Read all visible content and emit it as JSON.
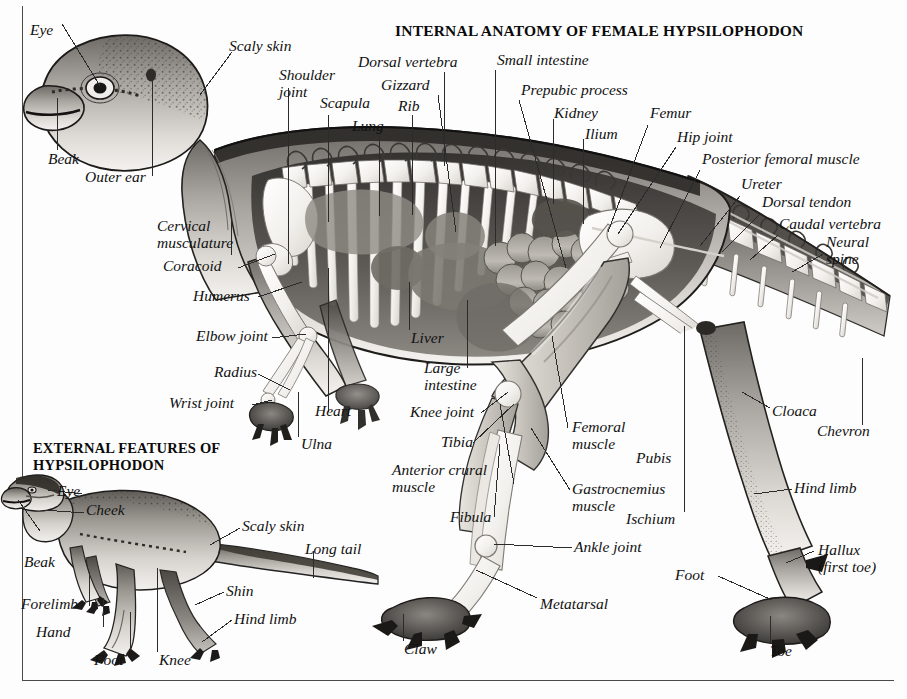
{
  "page": {
    "main_title": "INTERNAL ANATOMY OF FEMALE HYPSILOPHODON",
    "sub_title": "EXTERNAL FEATURES OF\nHYPSILOPHODON",
    "background_color": "#fdfdfd",
    "ink_color": "#111111",
    "frame_color": "#4a4a4a"
  },
  "internal_labels": [
    {
      "id": "eye",
      "text": "Eye"
    },
    {
      "id": "scaly-skin",
      "text": "Scaly skin"
    },
    {
      "id": "beak",
      "text": "Beak"
    },
    {
      "id": "outer-ear",
      "text": "Outer ear"
    },
    {
      "id": "shoulder-joint",
      "text": "Shoulder\njoint"
    },
    {
      "id": "scapula",
      "text": "Scapula"
    },
    {
      "id": "lung",
      "text": "Lung"
    },
    {
      "id": "dorsal-vertebra",
      "text": "Dorsal vertebra"
    },
    {
      "id": "gizzard",
      "text": "Gizzard"
    },
    {
      "id": "rib",
      "text": "Rib"
    },
    {
      "id": "small-intestine",
      "text": "Small intestine"
    },
    {
      "id": "prepubic-process",
      "text": "Prepubic process"
    },
    {
      "id": "kidney",
      "text": "Kidney"
    },
    {
      "id": "ilium",
      "text": "Ilium"
    },
    {
      "id": "femur",
      "text": "Femur"
    },
    {
      "id": "hip-joint",
      "text": "Hip joint"
    },
    {
      "id": "posterior-femoral-muscle",
      "text": "Posterior femoral muscle"
    },
    {
      "id": "ureter",
      "text": "Ureter"
    },
    {
      "id": "dorsal-tendon",
      "text": "Dorsal tendon"
    },
    {
      "id": "caudal-vertebra",
      "text": "Caudal vertebra"
    },
    {
      "id": "neural-spine",
      "text": "Neural\nspine"
    },
    {
      "id": "cervical-musculature",
      "text": "Cervical\nmusculature"
    },
    {
      "id": "coracoid",
      "text": "Coracoid"
    },
    {
      "id": "humerus",
      "text": "Humerus"
    },
    {
      "id": "elbow-joint",
      "text": "Elbow joint"
    },
    {
      "id": "radius",
      "text": "Radius"
    },
    {
      "id": "wrist-joint",
      "text": "Wrist joint"
    },
    {
      "id": "heart",
      "text": "Heart"
    },
    {
      "id": "ulna",
      "text": "Ulna"
    },
    {
      "id": "liver",
      "text": "Liver"
    },
    {
      "id": "large-intestine",
      "text": "Large\nintestine"
    },
    {
      "id": "knee-joint",
      "text": "Knee joint"
    },
    {
      "id": "tibia",
      "text": "Tibia"
    },
    {
      "id": "anterior-crural-muscle",
      "text": "Anterior crural\nmuscle"
    },
    {
      "id": "fibula",
      "text": "Fibula"
    },
    {
      "id": "femoral-muscle",
      "text": "Femoral\nmuscle"
    },
    {
      "id": "gastrocnemius-muscle",
      "text": "Gastrocnemius\nmuscle"
    },
    {
      "id": "pubis",
      "text": "Pubis"
    },
    {
      "id": "ischium",
      "text": "Ischium"
    },
    {
      "id": "ankle-joint",
      "text": "Ankle joint"
    },
    {
      "id": "metatarsal",
      "text": "Metatarsal"
    },
    {
      "id": "claw",
      "text": "Claw"
    },
    {
      "id": "cloaca",
      "text": "Cloaca"
    },
    {
      "id": "chevron",
      "text": "Chevron"
    },
    {
      "id": "hind-limb-internal",
      "text": "Hind limb"
    },
    {
      "id": "hallux",
      "text": "Hallux\n(first toe)"
    },
    {
      "id": "foot-internal",
      "text": "Foot"
    },
    {
      "id": "toe",
      "text": "Toe"
    }
  ],
  "external_labels": [
    {
      "id": "ext-eye",
      "text": "Eye"
    },
    {
      "id": "ext-cheek",
      "text": "Cheek"
    },
    {
      "id": "ext-beak",
      "text": "Beak"
    },
    {
      "id": "ext-scaly-skin",
      "text": "Scaly skin"
    },
    {
      "id": "ext-long-tail",
      "text": "Long tail"
    },
    {
      "id": "ext-forelimb",
      "text": "Forelimb"
    },
    {
      "id": "ext-hand",
      "text": "Hand"
    },
    {
      "id": "ext-foot",
      "text": "Foot"
    },
    {
      "id": "ext-knee",
      "text": "Knee"
    },
    {
      "id": "ext-shin",
      "text": "Shin"
    },
    {
      "id": "ext-hind-limb",
      "text": "Hind limb"
    }
  ]
}
